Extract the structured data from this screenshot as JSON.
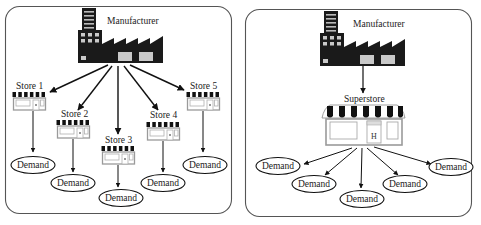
{
  "diagram": {
    "left_panel": {
      "title": "Decentralized distribution",
      "manufacturer_label": "Manufacturer",
      "stores": [
        {
          "label": "Store 1",
          "demand_label": "Demand"
        },
        {
          "label": "Store 2",
          "demand_label": "Demand"
        },
        {
          "label": "Store 3",
          "demand_label": "Demand"
        },
        {
          "label": "Store 4",
          "demand_label": "Demand"
        },
        {
          "label": "Store 5",
          "demand_label": "Demand"
        }
      ]
    },
    "right_panel": {
      "manufacturer_label": "Manufacturer",
      "superstore_label": "Superstore",
      "store_door_glyph": "H",
      "demands": [
        "Demand",
        "Demand",
        "Demand",
        "Demand",
        "Demand"
      ]
    },
    "colors": {
      "factory": "#1a1a1a",
      "factory_window": "#c9c9c9",
      "store_frame": "#9a9a9a",
      "awning_dark": "#111111",
      "panel_border": "#555555",
      "arrow": "#111111"
    }
  }
}
